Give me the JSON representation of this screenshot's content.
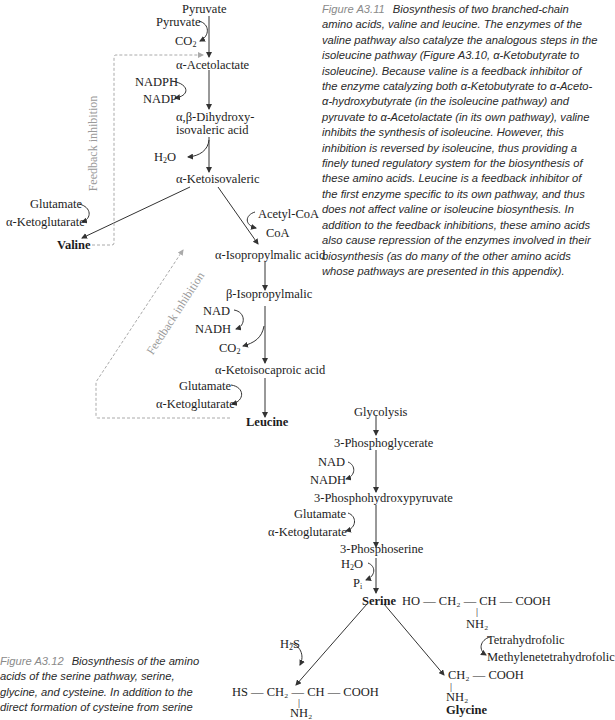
{
  "figure_a3_11": {
    "pathway": {
      "pyruvate_top": "Pyruvate",
      "pyruvate_in": "Pyruvate",
      "co2_1": "CO",
      "co2_1_sub": "2",
      "acetolactate": "α-Acetolactate",
      "nadph": "NADPH",
      "nadp": "NADP",
      "dihydroxy_1": "α,β-Dihydroxy-",
      "dihydroxy_2": "isovaleric acid",
      "h2o_h": "H",
      "h2o_sub": "2",
      "h2o_o": "O",
      "ketoisovaleric": "α-Ketoisovaleric",
      "glutamate_1": "Glutamate",
      "ketoglutarate_1": "α-Ketoglutarate",
      "valine": "Valine",
      "acetyl_coa": "Acetyl-CoA",
      "coa": "CoA",
      "isopropylmalic_alpha": "α-Isopropylmalic acid",
      "isopropylmalic_beta": "β-Isopropylmalic",
      "nad": "NAD",
      "nadh": "NADH",
      "co2_2": "CO",
      "co2_2_sub": "2",
      "ketoisocaproic": "α-Ketoisocaproic acid",
      "glutamate_2": "Glutamate",
      "ketoglutarate_2": "α-Ketoglutarate",
      "leucine": "Leucine",
      "feedback_1": "Feedback inhibition",
      "feedback_2": "Feedback inhibition"
    },
    "caption": {
      "label": "Figure A3.11",
      "text": "Biosynthesis of two branched-chain amino acids, valine and leucine. The enzymes of the valine pathway also catalyze the analogous steps in the isoleucine pathway (Figure A3.10, α-Ketobutyrate to isoleucine). Because valine is a feedback inhibitor of the enzyme catalyzing both α-Ketobutyrate to α-Aceto-α-hydroxybutyrate (in the isoleucine pathway) and pyruvate to α-Acetolactate (in its own pathway), valine inhibits the synthesis of isoleucine. However, this inhibition is reversed by isoleucine, thus providing a finely tuned regulatory system for the biosynthesis of these amino acids. Leucine is a feedback inhibitor of the first enzyme specific to its own pathway, and thus does not affect valine or isoleucine biosynthesis. In addition to the feedback inhibitions, these amino acids also cause repression of the enzymes involved in their biosynthesis (as do many of the other amino acids whose pathways are presented in this appendix)."
    }
  },
  "figure_a3_12": {
    "pathway": {
      "glycolysis": "Glycolysis",
      "phosphoglycerate": "3-Phosphoglycerate",
      "nad": "NAD",
      "nadh": "NADH",
      "phosphohydroxypyruvate": "3-Phosphohydroxypyruvate",
      "glutamate": "Glutamate",
      "ketoglutarate": "α-Ketoglutarate",
      "phosphoserine": "3-Phosphoserine",
      "h2o_h": "H",
      "h2o_sub": "2",
      "h2o_o": "O",
      "pi_p": "P",
      "pi_sub": "i",
      "serine": "Serine",
      "serine_formula": "HO — CH₂ — CH — COOH",
      "serine_nh2": "NH₂",
      "h2s_h": "H",
      "h2s_sub": "2",
      "h2s_s": "S",
      "cysteine_formula": "HS — CH₂ — CH — COOH",
      "cysteine_nh2": "NH₂",
      "tetrahydrofolic": "Tetrahydrofolic",
      "methylenetetrahydrofolic": "Methylenetetrahydrofolic",
      "glycine_formula": "CH₂ — COOH",
      "glycine_nh2": "NH₂",
      "glycine": "Glycine"
    },
    "caption": {
      "label": "Figure A3.12",
      "text_lines": [
        "Biosynthesis of the amino",
        "acids of the serine pathway, serine,",
        "glycine, and cysteine. In addition to the",
        "direct formation of cysteine from serine"
      ]
    }
  }
}
